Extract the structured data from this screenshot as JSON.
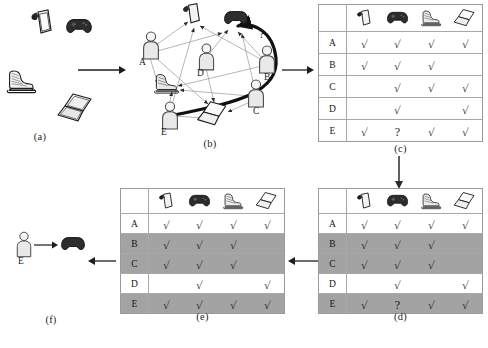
{
  "figure": {
    "panels": [
      {
        "id": "a",
        "caption": "(a)"
      },
      {
        "id": "b",
        "caption": "(b)"
      },
      {
        "id": "c",
        "caption": "(c)"
      },
      {
        "id": "d",
        "caption": "(d)"
      },
      {
        "id": "e",
        "caption": "(e)"
      },
      {
        "id": "f",
        "caption": "(f)"
      }
    ]
  },
  "items": [
    {
      "key": "tablet",
      "icon": "tablet-icon",
      "label": "tablet"
    },
    {
      "key": "gamepad",
      "icon": "gamepad-icon",
      "label": "gamepad"
    },
    {
      "key": "skate",
      "icon": "ice-skate-icon",
      "label": "ice skate"
    },
    {
      "key": "laptop",
      "icon": "laptop-icon",
      "label": "laptop"
    }
  ],
  "users": [
    "A",
    "B",
    "C",
    "D",
    "E"
  ],
  "symbols": {
    "check": "√",
    "question": "?",
    "blank": ""
  },
  "colors": {
    "highlight_row": "#a3a3a3",
    "table_border": "#a8a8a8",
    "ink": "#1a1a1a",
    "edge": "#9b9b9b",
    "gamepad_dark": "#2f2f2f"
  },
  "panel_a": {
    "caption": "(a)",
    "items": [
      "tablet",
      "gamepad",
      "ice skate",
      "laptop"
    ]
  },
  "panel_b": {
    "caption": "(b)",
    "user_labels": [
      "A",
      "B",
      "C",
      "D",
      "E"
    ],
    "query_marker": "?",
    "description": "bipartite user-item interaction graph with unknown edge E to gamepad"
  },
  "panel_c": {
    "caption": "(c)",
    "col_headers": [
      "tablet",
      "gamepad",
      "ice skate",
      "laptop"
    ],
    "rows": [
      {
        "user": "A",
        "cells": [
          "√",
          "√",
          "√",
          "√"
        ],
        "highlight": false
      },
      {
        "user": "B",
        "cells": [
          "√",
          "√",
          "√",
          ""
        ],
        "highlight": false
      },
      {
        "user": "C",
        "cells": [
          "",
          "√",
          "√",
          "√"
        ],
        "highlight": false
      },
      {
        "user": "D",
        "cells": [
          "",
          "√",
          "",
          "√"
        ],
        "highlight": false
      },
      {
        "user": "E",
        "cells": [
          "√",
          "?",
          "√",
          "√"
        ],
        "highlight": false
      }
    ]
  },
  "panel_d": {
    "caption": "(d)",
    "col_headers": [
      "tablet",
      "gamepad",
      "ice skate",
      "laptop"
    ],
    "rows": [
      {
        "user": "A",
        "cells": [
          "√",
          "√",
          "√",
          "√"
        ],
        "highlight": false
      },
      {
        "user": "B",
        "cells": [
          "√",
          "√",
          "√",
          ""
        ],
        "highlight": true
      },
      {
        "user": "C",
        "cells": [
          "√",
          "√",
          "√",
          ""
        ],
        "highlight": true
      },
      {
        "user": "D",
        "cells": [
          "",
          "√",
          "",
          "√"
        ],
        "highlight": false
      },
      {
        "user": "E",
        "cells": [
          "√",
          "?",
          "√",
          "√"
        ],
        "highlight": true
      }
    ]
  },
  "panel_e": {
    "caption": "(e)",
    "col_headers": [
      "tablet",
      "gamepad",
      "ice skate",
      "laptop"
    ],
    "rows": [
      {
        "user": "A",
        "cells": [
          "√",
          "√",
          "√",
          "√"
        ],
        "highlight": false
      },
      {
        "user": "B",
        "cells": [
          "√",
          "√",
          "√",
          ""
        ],
        "highlight": true
      },
      {
        "user": "C",
        "cells": [
          "√",
          "√",
          "√",
          ""
        ],
        "highlight": true
      },
      {
        "user": "D",
        "cells": [
          "",
          "√",
          "",
          "√"
        ],
        "highlight": false
      },
      {
        "user": "E",
        "cells": [
          "√",
          "√",
          "√",
          "√"
        ],
        "highlight": true
      }
    ]
  },
  "panel_f": {
    "caption": "(f)",
    "user_label": "E",
    "recommended_item": "gamepad"
  }
}
